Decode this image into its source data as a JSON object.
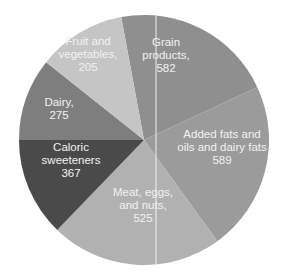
{
  "chart_data": {
    "type": "pie",
    "title": "",
    "unit": "",
    "categories": [
      "Grain products",
      "Added fats and oils and dairy fats",
      "Meat, eggs, and nuts",
      "Caloric sweeteners",
      "Dairy",
      "Fruit and vegetables"
    ],
    "values": [
      582,
      589,
      525,
      367,
      275,
      205
    ],
    "slices": [
      {
        "name": "Grain products",
        "value": 582,
        "label_lines": [
          "Grain",
          "products,",
          "582"
        ],
        "color": "#8f8f8f",
        "start_deg": 349.5,
        "end_deg": 425,
        "label_pos": [
          166,
          55
        ]
      },
      {
        "name": "Added fats and oils and dairy fats",
        "value": 589,
        "label_lines": [
          "Added fats and",
          "oils and dairy fats",
          "589"
        ],
        "color": "#9b9b9b",
        "start_deg": 65,
        "end_deg": 144,
        "label_pos": [
          222,
          147
        ]
      },
      {
        "name": "Meat, eggs, and nuts",
        "value": 525,
        "label_lines": [
          "Meat, eggs,",
          "and nuts,",
          "525"
        ],
        "color": "#b1b1b1",
        "start_deg": 144,
        "end_deg": 224,
        "label_pos": [
          143,
          205
        ]
      },
      {
        "name": "Caloric sweeteners",
        "value": 367,
        "label_lines": [
          "Caloric",
          "sweeteners",
          "367"
        ],
        "color": "#4a4a4a",
        "start_deg": 224,
        "end_deg": 270,
        "label_pos": [
          71,
          160
        ]
      },
      {
        "name": "Dairy",
        "value": 275,
        "label_lines": [
          "Dairy,",
          "275"
        ],
        "color": "#7e7e7e",
        "start_deg": 270,
        "end_deg": 308.5,
        "label_pos": [
          59,
          108
        ]
      },
      {
        "name": "Fruit and vegetables",
        "value": 205,
        "label_lines": [
          "Fruit and",
          "vegetables,",
          "205"
        ],
        "color": "#c5c5c5",
        "start_deg": 308.5,
        "end_deg": 349.5,
        "label_pos": [
          88,
          54
        ]
      }
    ],
    "center": [
      144,
      140
    ],
    "radius": 125,
    "divider_line_x": 156,
    "legend": "none",
    "grid": false
  }
}
